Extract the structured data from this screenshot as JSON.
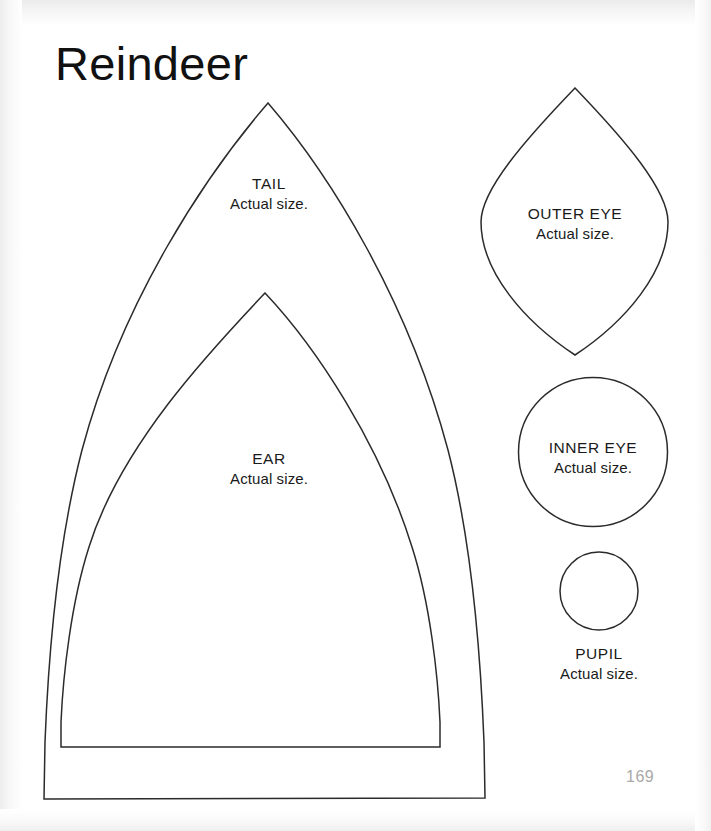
{
  "page": {
    "title": "Reindeer",
    "page_number": "169",
    "background_color": "#ffffff",
    "ink_color": "#2b2b2b",
    "page_number_color": "#a9a9a9"
  },
  "patterns": [
    {
      "id": "tail",
      "name": "TAIL",
      "note": "Actual size.",
      "shape": "pointed-arch",
      "icon": "tail-pattern-outline"
    },
    {
      "id": "ear",
      "name": "EAR",
      "note": "Actual size.",
      "shape": "pointed-arch",
      "icon": "ear-pattern-outline"
    },
    {
      "id": "outer-eye",
      "name": "OUTER EYE",
      "note": "Actual size.",
      "shape": "vesica-leaf",
      "icon": "outer-eye-pattern-outline"
    },
    {
      "id": "inner-eye",
      "name": "INNER EYE",
      "note": "Actual size.",
      "shape": "circle",
      "icon": "inner-eye-pattern-outline"
    },
    {
      "id": "pupil",
      "name": "PUPIL",
      "note": "Actual size.",
      "shape": "circle",
      "icon": "pupil-pattern-outline"
    }
  ]
}
